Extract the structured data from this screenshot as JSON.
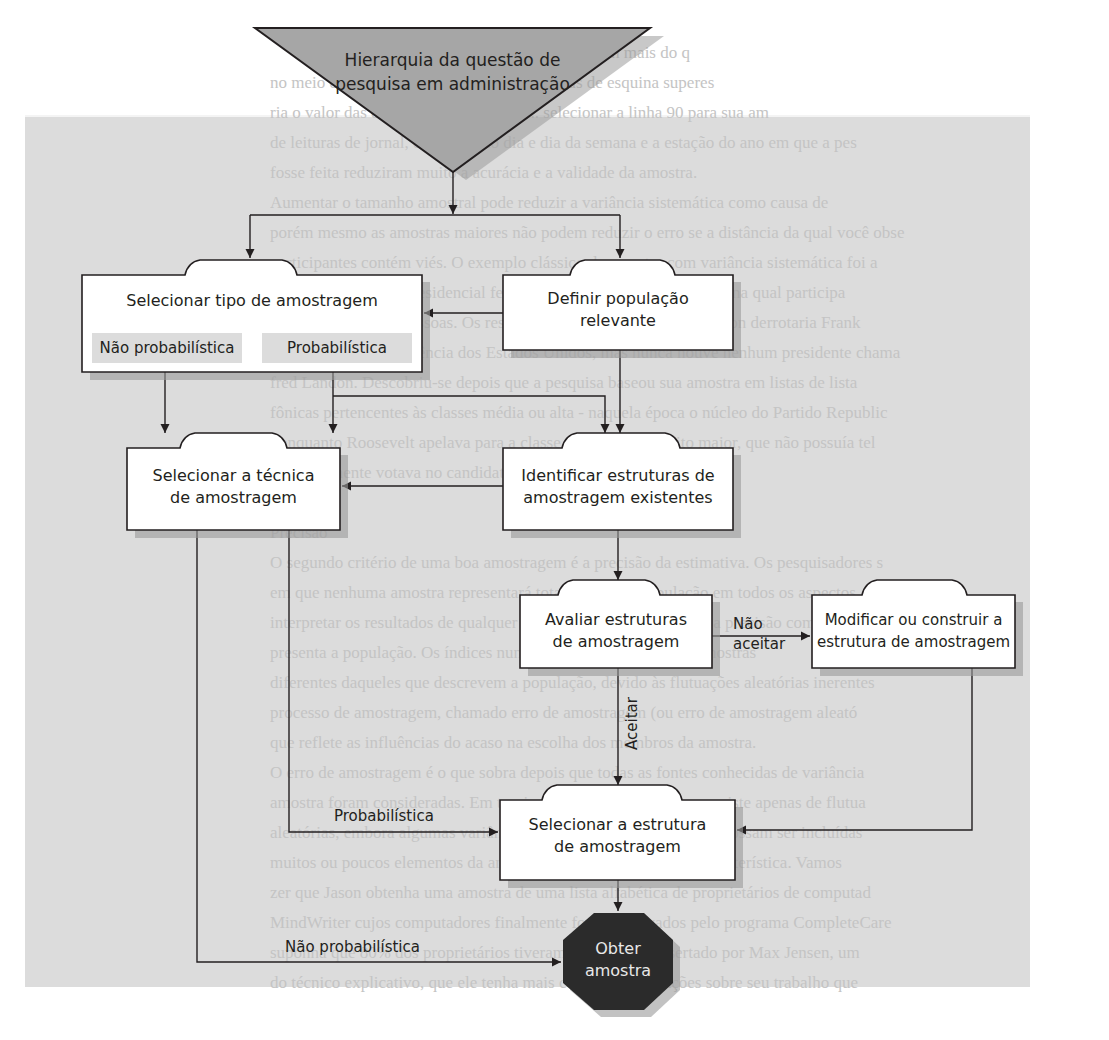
{
  "background": {
    "lines": [
      "Por exemplo, essas sondagens ... casas e valem mais do q",
      "no meio do quarteirão. Assim, ... apenas casas de esquina superes",
      "ria o valor das casas na área. Embora ... selecionar a linha 90 para sua am",
      "de leituras de jornal, o período do dia e dia da semana e a estação do ano em que a pes",
      "fosse feita reduziram muito a acurácia e a validade da amostra.",
      "Aumentar o tamanho amostral pode reduzir a variância sistemática como causa de",
      "porém mesmo as amostras maiores não podem reduzir o erro se a distância da qual você obse",
      "participantes contém viés. O exemplo clássico de amostra com variância sistemática foi a",
      "quisa sobre eleição presidencial feita pela Literary Digest em 1936, na qual participa",
      "de dois milhões de pessoas. Os resultados previam que Alfred Landon derrotaria Frank",
      "na disputa pela presidência dos Estados Unidos, mas nunca houve nenhum presidente chama",
      "fred Landon. Descobriu-se depois que a pesquisa baseou sua amostra em listas de lista",
      "fônicas pertencentes às classes média ou alta - naquela época o núcleo do Partido Republic",
      "- enquanto Roosevelt apelava para a classe trabalhadora muito maior, que não possuía tel",
      "e normalmente votava no candidato do Partido Democrata.",
      "",
      "Precisão",
      "O segundo critério de uma boa amostragem é a precisão da estimativa. Os pesquisadores s",
      "em que nenhuma amostra representará totalmente sua população em todos os aspectos.",
      "interpretar os resultados de qualquer pesquisa, precisamos medir a precisão com que a amost",
      "presenta a população. Os índices numéricos que descrevem as amostras",
      "diferentes daqueles que descrevem a população, devido às flutuações aleatórias inerentes",
      "processo de amostragem, chamado erro de amostragem (ou erro de amostragem aleató",
      "que reflete as influências do acaso na escolha dos membros da amostra.",
      "O erro de amostragem é o que sobra depois que todas as fontes conhecidas de variância",
      "amostra foram consideradas. Em teoria, o erro de amostragem consiste apenas de flutua",
      "aleatórias, embora algumas variâncias sistemáticas desconhecidas possam ser incluídas",
      "muitos ou poucos elementos da amostra possuem determinada característica. Vamos",
      "zer que Jason obtenha uma amostra de uma lista alfabética de proprietários de computad",
      "MindWriter cujos computadores finalmente foram aprovados pelo programa CompleteCare",
      "suponha que 80% dos proprietários tiveram seu laptop consertado por Max Jensen, um",
      "do técnico explicativo, que ele tenha mais certo de reclamações sobre seu trabalho que"
    ]
  },
  "diagram": {
    "start_node": {
      "shape": "inverted-triangle",
      "label_line1": "Hierarquia da questão de",
      "label_line2": "pesquisa em administração",
      "fill": "#a6a6a6"
    },
    "nodes": {
      "select_sampling_type": {
        "label": "Selecionar tipo de amostragem",
        "option_nonprob": "Não probabilística",
        "option_prob": "Probabilística"
      },
      "define_population": {
        "label_line1": "Definir população",
        "label_line2": "relevante"
      },
      "select_technique": {
        "label_line1": "Selecionar a técnica",
        "label_line2": "de amostragem"
      },
      "identify_frames": {
        "label_line1": "Identificar estruturas de",
        "label_line2": "amostragem existentes"
      },
      "evaluate_frames": {
        "label_line1": "Avaliar estruturas",
        "label_line2": "de amostragem"
      },
      "modify_frame": {
        "label_line1": "Modificar ou construir a",
        "label_line2": "estrutura de amostragem"
      },
      "select_frame": {
        "label_line1": "Selecionar a estrutura",
        "label_line2": "de amostragem"
      },
      "obtain_sample": {
        "shape": "octagon",
        "label_line1": "Obter",
        "label_line2": "amostra",
        "fill": "#2b2b2b"
      }
    },
    "edge_labels": {
      "not_accept_line1": "Não",
      "not_accept_line2": "aceitar",
      "accept": "Aceitar",
      "probabilistic": "Probabilística",
      "non_probabilistic": "Não probabilística"
    },
    "colors": {
      "line": "#231f20",
      "box_fill": "#ffffff",
      "shadow": "#9a9a9a",
      "panel": "#dcdcdc"
    }
  }
}
